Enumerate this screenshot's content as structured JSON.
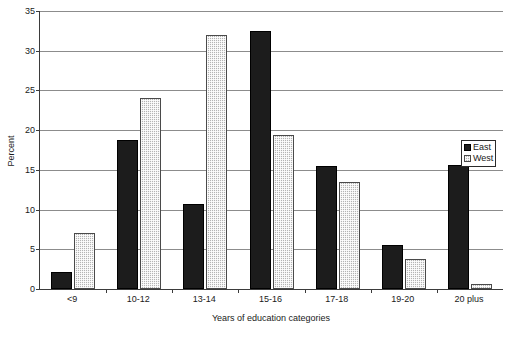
{
  "chart_data": {
    "type": "bar",
    "title": "",
    "xlabel": "Years of education categories",
    "ylabel": "Percent",
    "categories": [
      "<9",
      "10-12",
      "13-14",
      "15-16",
      "17-18",
      "19-20",
      "20 plus"
    ],
    "series": [
      {
        "name": "East",
        "values": [
          2.2,
          18.7,
          10.7,
          32.5,
          15.5,
          5.6,
          15.6
        ]
      },
      {
        "name": "West",
        "values": [
          7.0,
          24.0,
          32.0,
          19.4,
          13.5,
          3.8,
          0.6
        ]
      }
    ],
    "ylim": [
      0,
      35
    ],
    "ytick_values": [
      0,
      5,
      10,
      15,
      20,
      25,
      30,
      35
    ],
    "ytick_labels": [
      "0",
      "5",
      "10",
      "15",
      "20",
      "25",
      "30",
      "35"
    ],
    "grid": true,
    "legend_position": "right",
    "legend": [
      "East",
      "West"
    ],
    "colors": {
      "east": "#1c1c1c",
      "west": "#b4b4b4",
      "grid": "#8c8c8c",
      "axis": "#3b3b3b",
      "text": "#1a1a1a"
    }
  }
}
